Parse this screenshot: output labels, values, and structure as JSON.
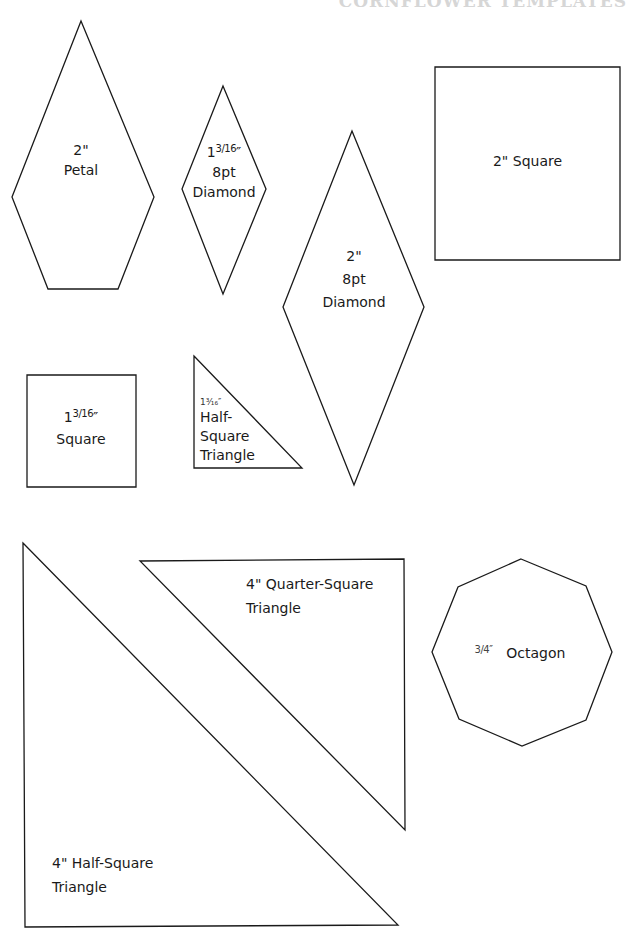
{
  "header": {
    "title": "CORNFLOWER TEMPLATES"
  },
  "colors": {
    "outline": "#1a1a1a",
    "background": "#ffffff",
    "header": "#d6d6d6"
  },
  "templates": [
    {
      "id": "petal",
      "size": "2\"",
      "name": "Petal",
      "points": "81,21 154,197 118,289 48,289 12,197"
    },
    {
      "id": "small-diamond",
      "whole": "1",
      "fraction": "3/16",
      "unit": "″",
      "line2": "8pt",
      "line3": "Diamond",
      "points": "223,86 266,189 223,294 182,189"
    },
    {
      "id": "large-diamond",
      "size": "2\"",
      "line2": "8pt",
      "line3": "Diamond",
      "points": "352,131 424,307 354,485 283,307"
    },
    {
      "id": "large-square",
      "label": "2\" Square",
      "points": "435,67 620,67 620,260 435,260"
    },
    {
      "id": "small-square",
      "whole": "1",
      "fraction": "3/16",
      "unit": "″",
      "name": "Square",
      "points": "27,375 136,375 136,487 27,487"
    },
    {
      "id": "small-hst",
      "size": "1³⁄₁₆″",
      "line2": "Half-",
      "line3": "Square",
      "line4": "Triangle",
      "points": "194,356 302,468 194,468"
    },
    {
      "id": "large-hst",
      "line1": "4\" Half-Square",
      "line2": "Triangle",
      "points": "23,543 398,925 25,927"
    },
    {
      "id": "qst",
      "line1": "4\" Quarter-Square",
      "line2": "Triangle",
      "points": "140,561 404,559 405,830"
    },
    {
      "id": "octagon",
      "fraction": "3/4",
      "unit": "″",
      "name": "Octagon",
      "points": "521,559 586,586 612,652 586,720 522,746 459,719 432,652 458,587"
    }
  ]
}
